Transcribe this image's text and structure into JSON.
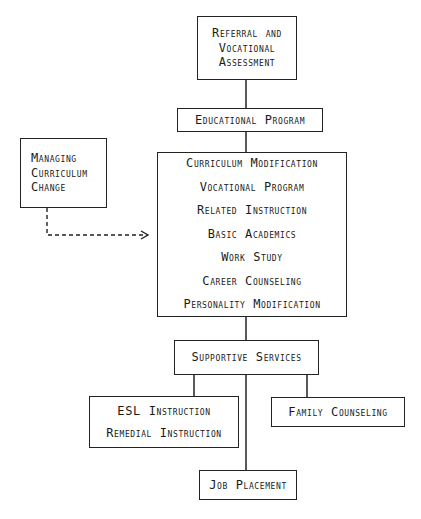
{
  "diagram": {
    "nodes": {
      "referral": {
        "lines": [
          "Referral and",
          "Vocational",
          "Assessment"
        ]
      },
      "educational_program": {
        "label": "Educational Program"
      },
      "managing_change": {
        "lines": [
          "Managing",
          "Curriculum",
          "Change"
        ]
      },
      "program_components": {
        "items": [
          "Curriculum Modification",
          "Vocational Program",
          "Related Instruction",
          "Basic Academics",
          "Work Study",
          "Career Counseling",
          "Personality Modification"
        ]
      },
      "supportive_services": {
        "label": "Supportive Services"
      },
      "esl_remedial": {
        "lines": [
          "ESL Instruction",
          "Remedial Instruction"
        ]
      },
      "family_counseling": {
        "label": "Family Counseling"
      },
      "job_placement": {
        "label": "Job Placement"
      }
    },
    "edges": [
      {
        "from": "referral",
        "to": "educational_program",
        "style": "solid"
      },
      {
        "from": "educational_program",
        "to": "program_components",
        "style": "solid"
      },
      {
        "from": "managing_change",
        "to": "program_components",
        "style": "dashed-arrow"
      },
      {
        "from": "program_components",
        "to": "supportive_services",
        "style": "solid"
      },
      {
        "from": "supportive_services",
        "to": "esl_remedial",
        "style": "solid"
      },
      {
        "from": "supportive_services",
        "to": "family_counseling",
        "style": "solid"
      },
      {
        "from": "supportive_services",
        "to": "job_placement",
        "style": "solid"
      }
    ],
    "colors": {
      "line": "#222222",
      "background": "#ffffff"
    }
  }
}
